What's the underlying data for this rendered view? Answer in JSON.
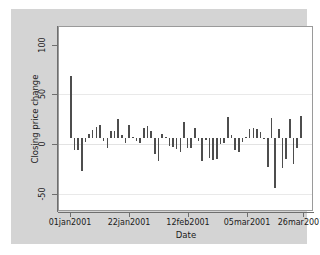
{
  "chart_data": {
    "type": "bar",
    "title": "",
    "xlabel": "Date",
    "ylabel": "Closing price change",
    "ylim": [
      -75,
      115
    ],
    "yticks": [
      100,
      50,
      0,
      -50
    ],
    "ytick_labels": [
      "100",
      "50",
      "0",
      "-50"
    ],
    "xtick_labels": [
      "01jan2001",
      "22jan2001",
      "12feb2001",
      "05mar2001",
      "26mar2001"
    ],
    "xtick_values": [
      "01jan2001",
      "22jan2001",
      "12feb2001",
      "05mar2001",
      "26mar2001"
    ],
    "grid": true,
    "gridlines_at": [
      50,
      0,
      -50
    ],
    "legend": "none",
    "bar_color": "#4d4d4d",
    "plot_background": "#ffffff",
    "canvas_background": "#d4d4d4",
    "baseline": 0,
    "x": [
      "02jan2001",
      "03jan2001",
      "04jan2001",
      "05jan2001",
      "08jan2001",
      "09jan2001",
      "10jan2001",
      "11jan2001",
      "12jan2001",
      "15jan2001",
      "16jan2001",
      "17jan2001",
      "18jan2001",
      "19jan2001",
      "22jan2001",
      "23jan2001",
      "24jan2001",
      "25jan2001",
      "26jan2001",
      "29jan2001",
      "30jan2001",
      "31jan2001",
      "01feb2001",
      "02feb2001",
      "05feb2001",
      "06feb2001",
      "07feb2001",
      "08feb2001",
      "09feb2001",
      "12feb2001",
      "13feb2001",
      "14feb2001",
      "15feb2001",
      "16feb2001",
      "19feb2001",
      "20feb2001",
      "21feb2001",
      "22feb2001",
      "23feb2001",
      "26feb2001",
      "27feb2001",
      "28feb2001",
      "01mar2001",
      "02mar2001",
      "05mar2001",
      "06mar2001",
      "07mar2001",
      "08mar2001",
      "09mar2001",
      "12mar2001",
      "13mar2001",
      "14mar2001",
      "15mar2001",
      "16mar2001",
      "19mar2001",
      "20mar2001",
      "21mar2001",
      "22mar2001",
      "23mar2001",
      "26mar2001",
      "27mar2001",
      "28mar2001",
      "29mar2001",
      "30mar2001"
    ],
    "values": [
      64,
      -13,
      -13,
      -34,
      -4,
      4,
      8,
      11,
      13,
      -3,
      -11,
      7,
      7,
      19,
      3,
      -5,
      13,
      1,
      -3,
      -5,
      10,
      12,
      7,
      -17,
      -24,
      4,
      1,
      -9,
      -10,
      -12,
      -15,
      16,
      -11,
      -11,
      10,
      -3,
      -24,
      -2,
      -21,
      -23,
      -22,
      -6,
      -5,
      22,
      3,
      -13,
      -15,
      -4,
      1,
      9,
      10,
      9,
      6,
      -1,
      -30,
      21,
      -52,
      9,
      -31,
      -22,
      20,
      -27,
      -11,
      23
    ]
  }
}
